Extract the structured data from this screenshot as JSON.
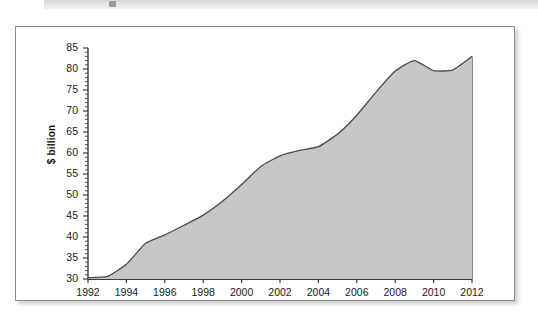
{
  "figure": {
    "top_strip_present": true
  },
  "chart_data": {
    "type": "area",
    "title": "",
    "subtitle": "",
    "xlabel": "",
    "ylabel": "$ billion",
    "xlim": [
      1992,
      2012
    ],
    "ylim": [
      30,
      85
    ],
    "y_major_ticks": [
      30,
      35,
      40,
      45,
      50,
      55,
      60,
      65,
      70,
      75,
      80,
      85
    ],
    "y_minor_tick_step": 1,
    "x_ticks": [
      1992,
      1994,
      1996,
      1998,
      2000,
      2002,
      2004,
      2006,
      2008,
      2010,
      2012
    ],
    "x_tick_labels": [
      "1992",
      "1994",
      "1996",
      "1998",
      "2000",
      "2002",
      "2004",
      "2006",
      "2008",
      "2010",
      "2012"
    ],
    "y_tick_labels": [
      "30",
      "35",
      "40",
      "45",
      "50",
      "55",
      "60",
      "65",
      "70",
      "75",
      "80",
      "85"
    ],
    "grid": false,
    "legend": false,
    "legend_position": "none",
    "fill_color": "#c6c6c6",
    "line_color": "#4a4a4a",
    "axis_color": "#3c3c3c",
    "background_color": "#ffffff",
    "x": [
      1992,
      1993,
      1994,
      1995,
      1996,
      1997,
      1998,
      1999,
      2000,
      2001,
      2002,
      2003,
      2004,
      2005,
      2006,
      2007,
      2008,
      2009,
      2010,
      2011,
      2012
    ],
    "values": [
      30.3,
      30.6,
      33.5,
      38.5,
      40.5,
      42.8,
      45.2,
      48.5,
      52.5,
      56.8,
      59.3,
      60.6,
      61.5,
      64.5,
      69.0,
      74.5,
      79.5,
      82.0,
      79.6,
      79.8,
      83.0
    ],
    "series": [
      {
        "name": "$ billion",
        "values": [
          30.3,
          30.6,
          33.5,
          38.5,
          40.5,
          42.8,
          45.2,
          48.5,
          52.5,
          56.8,
          59.3,
          60.6,
          61.5,
          64.5,
          69.0,
          74.5,
          79.5,
          82.0,
          79.6,
          79.8,
          83.0
        ]
      }
    ]
  }
}
